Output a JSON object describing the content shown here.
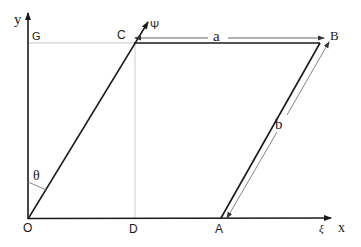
{
  "diagram": {
    "type": "geometry-parallelogram",
    "colors": {
      "stroke": "#1a1a1a",
      "guide": "#b8b8b8",
      "dimension": "#555555",
      "background": "#ffffff"
    },
    "axes": {
      "x_label": "x",
      "y_label": "y",
      "psi_label": "Ψ",
      "xi_label": "ξ"
    },
    "points": {
      "O": "O",
      "A": "A",
      "B": "B",
      "C": "C",
      "D": "D",
      "G": "G"
    },
    "dimensions": {
      "a": "a",
      "b": "b"
    },
    "angle": {
      "theta": "θ"
    }
  }
}
